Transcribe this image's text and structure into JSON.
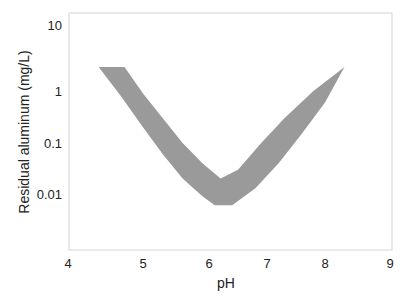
{
  "chart_data": {
    "type": "area",
    "title": "",
    "xlabel": "pH",
    "ylabel": "Residual aluminum (mg/L)",
    "xlim": [
      4,
      9
    ],
    "ylim": [
      0.001,
      10
    ],
    "yscale": "log",
    "grid": false,
    "legend": null,
    "x_ticks": [
      4,
      5,
      6,
      7,
      8,
      9
    ],
    "x_tick_labels": [
      "4",
      "5",
      "6",
      "7",
      "8",
      "9"
    ],
    "y_ticks": [
      10,
      1,
      0.1,
      0.01
    ],
    "y_tick_labels": [
      "10",
      "1",
      "0.1",
      "0.01"
    ],
    "band": {
      "name": "Residual aluminum range",
      "fill_color": "#9a9a9a",
      "upper": [
        {
          "x": 4.4,
          "y": 2.3
        },
        {
          "x": 4.75,
          "y": 2.3
        },
        {
          "x": 5.0,
          "y": 0.9
        },
        {
          "x": 5.3,
          "y": 0.3
        },
        {
          "x": 5.6,
          "y": 0.1
        },
        {
          "x": 5.9,
          "y": 0.04
        },
        {
          "x": 6.2,
          "y": 0.02
        },
        {
          "x": 6.5,
          "y": 0.03
        },
        {
          "x": 6.9,
          "y": 0.1
        },
        {
          "x": 7.3,
          "y": 0.3
        },
        {
          "x": 7.8,
          "y": 1.0
        },
        {
          "x": 8.3,
          "y": 2.3
        },
        {
          "x": 8.8,
          "y": 2.3
        }
      ],
      "lower": [
        {
          "x": 4.4,
          "y": 2.3
        },
        {
          "x": 4.7,
          "y": 0.8
        },
        {
          "x": 5.0,
          "y": 0.2
        },
        {
          "x": 5.3,
          "y": 0.06
        },
        {
          "x": 5.6,
          "y": 0.02
        },
        {
          "x": 5.9,
          "y": 0.009
        },
        {
          "x": 6.1,
          "y": 0.006
        },
        {
          "x": 6.4,
          "y": 0.006
        },
        {
          "x": 6.8,
          "y": 0.013
        },
        {
          "x": 7.2,
          "y": 0.04
        },
        {
          "x": 7.6,
          "y": 0.15
        },
        {
          "x": 8.0,
          "y": 0.6
        },
        {
          "x": 8.3,
          "y": 2.3
        }
      ]
    }
  },
  "axes": {
    "xlabel": "pH",
    "ylabel": "Residual aluminum (mg/L)",
    "x_tick_labels": [
      "4",
      "5",
      "6",
      "7",
      "8",
      "9"
    ],
    "y_tick_labels": [
      "10",
      "1",
      "0.1",
      "0.01"
    ]
  }
}
